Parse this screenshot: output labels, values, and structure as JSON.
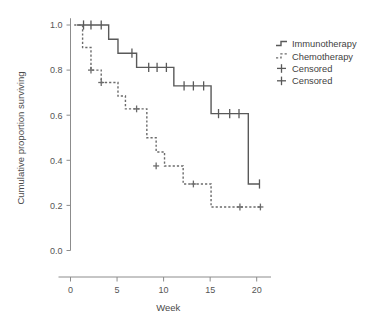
{
  "chart_data": {
    "type": "line",
    "subtype": "kaplan-meier-step",
    "title": "",
    "xlabel": "Week",
    "ylabel": "Cumulative proportion surviving",
    "xlim": [
      0,
      21
    ],
    "ylim": [
      0.0,
      1.05
    ],
    "xticks": [
      0,
      5,
      10,
      15,
      20
    ],
    "xtick_labels": [
      "0",
      "5",
      "10",
      "15",
      "20"
    ],
    "yticks": [
      0.0,
      0.2,
      0.4,
      0.6,
      0.8,
      1.0
    ],
    "ytick_labels": [
      "0.0",
      "0.2",
      "0.4",
      "0.6",
      "0.8",
      "1.0"
    ],
    "grid": false,
    "legend_position": "right-top",
    "series": [
      {
        "name": "Immunotherapy",
        "style": "solid",
        "color": "#595959",
        "steps": [
          {
            "week": 0.7,
            "surviving": 1.0
          },
          {
            "week": 4.1,
            "surviving": 1.0
          },
          {
            "week": 4.1,
            "surviving": 0.937
          },
          {
            "week": 5.1,
            "surviving": 0.937
          },
          {
            "week": 5.1,
            "surviving": 0.875
          },
          {
            "week": 7.1,
            "surviving": 0.875
          },
          {
            "week": 7.1,
            "surviving": 0.812
          },
          {
            "week": 11.1,
            "surviving": 0.812
          },
          {
            "week": 11.1,
            "surviving": 0.73
          },
          {
            "week": 15.1,
            "surviving": 0.73
          },
          {
            "week": 15.1,
            "surviving": 0.607
          },
          {
            "week": 19.1,
            "surviving": 0.607
          },
          {
            "week": 19.1,
            "surviving": 0.295
          },
          {
            "week": 20.3,
            "surviving": 0.295
          }
        ],
        "censored": [
          {
            "week": 1.4,
            "surviving": 1.0
          },
          {
            "week": 2.2,
            "surviving": 1.0
          },
          {
            "week": 3.3,
            "surviving": 1.0
          },
          {
            "week": 6.6,
            "surviving": 0.875
          },
          {
            "week": 8.4,
            "surviving": 0.812
          },
          {
            "week": 9.3,
            "surviving": 0.812
          },
          {
            "week": 10.3,
            "surviving": 0.812
          },
          {
            "week": 12.2,
            "surviving": 0.73
          },
          {
            "week": 13.2,
            "surviving": 0.73
          },
          {
            "week": 14.3,
            "surviving": 0.73
          },
          {
            "week": 15.9,
            "surviving": 0.607
          },
          {
            "week": 17.1,
            "surviving": 0.607
          },
          {
            "week": 18.1,
            "surviving": 0.607
          },
          {
            "week": 20.3,
            "surviving": 0.295
          }
        ]
      },
      {
        "name": "Chemotherapy",
        "style": "dashed",
        "color": "#6b6b6b",
        "steps": [
          {
            "week": 0.4,
            "surviving": 1.0
          },
          {
            "week": 1.3,
            "surviving": 1.0
          },
          {
            "week": 1.3,
            "surviving": 0.9
          },
          {
            "week": 2.2,
            "surviving": 0.9
          },
          {
            "week": 2.2,
            "surviving": 0.8
          },
          {
            "week": 3.3,
            "surviving": 0.8
          },
          {
            "week": 3.3,
            "surviving": 0.745
          },
          {
            "week": 5.1,
            "surviving": 0.745
          },
          {
            "week": 5.1,
            "surviving": 0.685
          },
          {
            "week": 5.9,
            "surviving": 0.685
          },
          {
            "week": 5.9,
            "surviving": 0.628
          },
          {
            "week": 8.2,
            "surviving": 0.628
          },
          {
            "week": 8.2,
            "surviving": 0.5
          },
          {
            "week": 9.2,
            "surviving": 0.5
          },
          {
            "week": 9.2,
            "surviving": 0.437
          },
          {
            "week": 10.1,
            "surviving": 0.437
          },
          {
            "week": 10.1,
            "surviving": 0.375
          },
          {
            "week": 12.1,
            "surviving": 0.375
          },
          {
            "week": 12.1,
            "surviving": 0.295
          },
          {
            "week": 15.1,
            "surviving": 0.295
          },
          {
            "week": 15.1,
            "surviving": 0.193
          },
          {
            "week": 20.4,
            "surviving": 0.193
          }
        ],
        "censored": [
          {
            "week": 2.2,
            "surviving": 0.8
          },
          {
            "week": 3.3,
            "surviving": 0.745
          },
          {
            "week": 7.1,
            "surviving": 0.628
          },
          {
            "week": 9.2,
            "surviving": 0.375
          },
          {
            "week": 13.2,
            "surviving": 0.295
          },
          {
            "week": 18.2,
            "surviving": 0.193
          },
          {
            "week": 20.4,
            "surviving": 0.193
          }
        ]
      }
    ],
    "legend": [
      {
        "label": "Immunotherapy",
        "marker": "solid-step-line"
      },
      {
        "label": "Chemotherapy",
        "marker": "dashed-step-line"
      },
      {
        "label": "Censored",
        "marker": "plus-mark"
      },
      {
        "label": "Censored",
        "marker": "plus-mark"
      }
    ]
  }
}
